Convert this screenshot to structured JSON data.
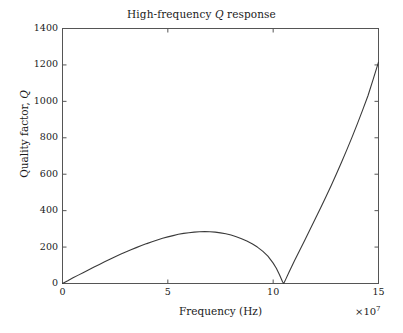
{
  "chart_data": {
    "type": "line",
    "title": "High-frequency Q response",
    "title_parts": {
      "before": "High-frequency ",
      "italic": "Q",
      "after": " response"
    },
    "xlabel": "Frequency (Hz)",
    "ylabel": "Quality factor, Q",
    "ylabel_parts": {
      "before": "Quality factor, ",
      "italic": "Q"
    },
    "x_exponent_text": "×10",
    "x_exponent_power": "7",
    "x_exponent_full": "×10⁷",
    "xlim": [
      0,
      15
    ],
    "ylim": [
      0,
      1400
    ],
    "xticks": [
      0,
      5,
      10,
      15
    ],
    "xtick_labels": [
      "0",
      "5",
      "10",
      "15"
    ],
    "yticks": [
      0,
      200,
      400,
      600,
      800,
      1000,
      1200,
      1400
    ],
    "ytick_labels": [
      "0",
      "200",
      "400",
      "600",
      "800",
      "1000",
      "1200",
      "1400"
    ],
    "grid": false,
    "legend": null,
    "tick_direction": "in",
    "axes_box": true,
    "x_units_note": "x values are in units of 1e7 Hz",
    "series": [
      {
        "name": "Quality factor Q",
        "color": "#3a3a3a",
        "line_width": 1.1,
        "x": [
          0.0,
          0.25,
          0.5,
          0.75,
          1.0,
          1.25,
          1.5,
          1.75,
          2.0,
          2.25,
          2.5,
          2.75,
          3.0,
          3.25,
          3.5,
          3.75,
          4.0,
          4.25,
          4.5,
          4.75,
          5.0,
          5.25,
          5.5,
          5.75,
          6.0,
          6.25,
          6.5,
          6.75,
          7.0,
          7.25,
          7.5,
          7.75,
          8.0,
          8.25,
          8.5,
          8.75,
          9.0,
          9.25,
          9.5,
          9.75,
          10.0,
          10.15,
          10.3,
          10.45,
          10.5,
          10.6,
          10.75,
          11.0,
          11.25,
          11.5,
          11.75,
          12.0,
          12.25,
          12.5,
          12.75,
          13.0,
          13.25,
          13.5,
          13.75,
          14.0,
          14.25,
          14.5,
          14.75,
          15.0
        ],
        "y": [
          0,
          15,
          31,
          46,
          61,
          76,
          91,
          105,
          119,
          133,
          147,
          160,
          173,
          185,
          197,
          208,
          219,
          229,
          239,
          248,
          256,
          263,
          270,
          275,
          279,
          282,
          284,
          285,
          284,
          282,
          278,
          273,
          266,
          257,
          246,
          233,
          218,
          200,
          178,
          150,
          112,
          84,
          48,
          8,
          0,
          24,
          62,
          122,
          180,
          238,
          296,
          355,
          414,
          475,
          537,
          601,
          667,
          735,
          805,
          878,
          953,
          1031,
          1122,
          1215
        ]
      }
    ],
    "annotations": [
      {
        "text": "peak",
        "x": 6.0,
        "y": 285
      },
      {
        "text": "zero",
        "x": 10.5,
        "y": 0
      }
    ]
  },
  "colors": {
    "background": "#ffffff",
    "axis": "#555555",
    "curve": "#3a3a3a",
    "text": "#1a1a1a"
  }
}
